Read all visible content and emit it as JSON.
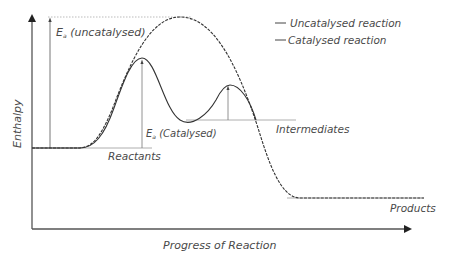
{
  "diagram": {
    "type": "energy-profile",
    "axes": {
      "y_label": "Enthalpy",
      "x_label": "Progress of Reaction"
    },
    "legend": {
      "items": [
        {
          "label": "Uncatalysed reaction",
          "style": "dashed"
        },
        {
          "label": "Catalysed reaction",
          "style": "solid"
        }
      ]
    },
    "annotations": {
      "ea_uncatalysed_main": "E",
      "ea_uncatalysed_sub": "a",
      "ea_uncatalysed_text": " (uncatalysed)",
      "ea_catalysed_main": "E",
      "ea_catalysed_sub": "a",
      "ea_catalysed_text": " (Catalysed)",
      "reactants": "Reactants",
      "intermediates": "Intermediates",
      "products": "Products"
    },
    "colors": {
      "curve": "#333333",
      "axis": "#555555",
      "guide": "#999999",
      "text": "#4a4a4a"
    }
  }
}
